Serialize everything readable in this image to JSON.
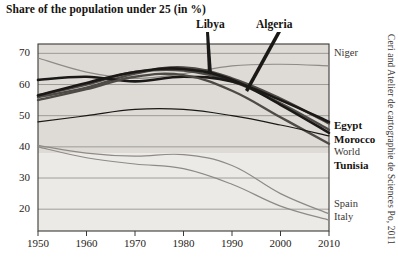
{
  "title": "Share of the population under 25 (in %)",
  "credit": "Ceri and Atelier de cartographie de Sciences Po, 2011",
  "callouts": [
    {
      "label": "Libya"
    },
    {
      "label": "Algeria"
    }
  ],
  "axis": {
    "y_ticks": [
      "70",
      "60",
      "50",
      "40",
      "30",
      "20"
    ],
    "x_ticks": [
      "1950",
      "1960",
      "1970",
      "1980",
      "1990",
      "2000",
      "2010"
    ]
  },
  "series_labels": [
    {
      "label": "Niger",
      "bold": false
    },
    {
      "label": "Egypt",
      "bold": true
    },
    {
      "label": "Morocco",
      "bold": true
    },
    {
      "label": "World",
      "bold": false
    },
    {
      "label": "Tunisia",
      "bold": true
    },
    {
      "label": "Spain",
      "bold": false
    },
    {
      "label": "Italy",
      "bold": false
    }
  ],
  "colors": {
    "plot_background": "#dedbd6",
    "plot_background_lower": "#eceae7",
    "frame": "#3c3935",
    "gridline": "#8d8a85",
    "dark_line": "#1b1917",
    "mid_line": "#4e4a46",
    "light_line": "#8e8a85",
    "text": "#16130f"
  },
  "chart_data": {
    "type": "line",
    "title": "Share of the population under 25 (in %)",
    "xlabel": "",
    "ylabel": "",
    "xlim": [
      1950,
      2010
    ],
    "ylim": [
      13,
      73
    ],
    "grid": true,
    "legend": "right-inline-labels",
    "x": [
      1950,
      1960,
      1970,
      1980,
      1990,
      2000,
      2010
    ],
    "series": [
      {
        "name": "Niger",
        "style": "light",
        "values": [
          68.5,
          64.0,
          62.0,
          63.5,
          66.0,
          66.5,
          66.0
        ]
      },
      {
        "name": "Libya",
        "style": "mid",
        "values": [
          56.0,
          59.0,
          63.5,
          65.5,
          62.0,
          55.5,
          47.5
        ]
      },
      {
        "name": "Algeria",
        "style": "mid",
        "values": [
          56.5,
          60.0,
          64.0,
          64.5,
          61.0,
          54.0,
          45.5
        ]
      },
      {
        "name": "Egypt",
        "style": "dark",
        "values": [
          61.5,
          62.5,
          61.0,
          62.5,
          61.0,
          55.0,
          48.0
        ]
      },
      {
        "name": "Morocco",
        "style": "dark",
        "values": [
          56.5,
          60.5,
          64.0,
          65.0,
          61.5,
          53.5,
          44.5
        ]
      },
      {
        "name": "Tunisia",
        "style": "mid",
        "values": [
          55.0,
          58.5,
          62.5,
          63.0,
          58.0,
          49.5,
          41.0
        ]
      },
      {
        "name": "World",
        "style": "dark-thin",
        "values": [
          48.0,
          50.0,
          52.0,
          52.0,
          50.0,
          47.0,
          43.5
        ]
      },
      {
        "name": "Spain",
        "style": "light",
        "values": [
          40.5,
          38.0,
          37.0,
          37.5,
          34.0,
          25.0,
          18.5
        ]
      },
      {
        "name": "Italy",
        "style": "light",
        "values": [
          40.0,
          36.5,
          34.5,
          33.0,
          28.0,
          21.0,
          16.5
        ]
      }
    ]
  }
}
